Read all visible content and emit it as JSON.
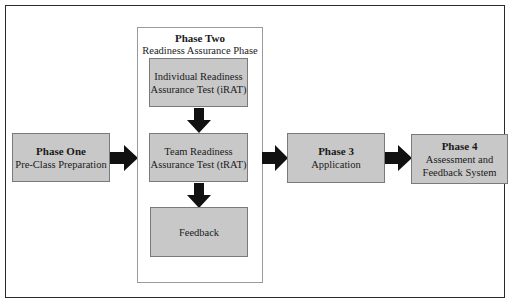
{
  "diagram": {
    "phase_one": {
      "title": "Phase One",
      "subtitle": "Pre-Class Preparation"
    },
    "phase_two": {
      "title": "Phase Two",
      "subtitle": "Readiness Assurance Phase",
      "steps": [
        {
          "line1": "Individual Readiness",
          "line2": "Assurance Test (iRAT)"
        },
        {
          "line1": "Team Readiness",
          "line2": "Assurance Test (tRAT)"
        },
        {
          "line1": "Feedback"
        }
      ]
    },
    "phase_three": {
      "title": "Phase 3",
      "subtitle": "Application"
    },
    "phase_four": {
      "title": "Phase 4",
      "line1": "Assessment and",
      "line2": "Feedback System"
    },
    "colors": {
      "box_fill": "#c8c8c8",
      "box_border": "#7a7a7a",
      "arrow": "#111111",
      "frame": "#2a2a2a"
    }
  }
}
